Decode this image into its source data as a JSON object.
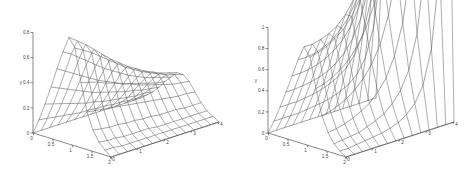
{
  "figure": {
    "type": "two-panel-3d-surface-figure",
    "background_color": "#ffffff",
    "line_color": "#6b6b6b",
    "axis_color": "#555555",
    "panels": [
      "left",
      "right"
    ]
  },
  "chart_data": [
    {
      "type": "line",
      "plot_style": "3d-mesh-surface",
      "panel": "left",
      "title": "",
      "xlabel": "",
      "ylabel": "y",
      "zlabel": "",
      "xlim": [
        0,
        2
      ],
      "ylim": [
        0,
        0.8
      ],
      "zlim": [
        0,
        4
      ],
      "grid": false,
      "legend": "none",
      "xticks": [
        "0",
        "0.5",
        "1",
        "1.5",
        "2"
      ],
      "xtick_values": [
        0,
        0.5,
        1,
        1.5,
        2
      ],
      "yticks": [
        "0",
        "0.2",
        "0.4",
        "0.6",
        "0.8"
      ],
      "ytick_values": [
        0,
        0.2,
        0.4,
        0.6,
        0.8
      ],
      "zticks": [
        "0",
        "1",
        "2",
        "3",
        "4"
      ],
      "ztick_values": [
        0,
        1,
        2,
        3,
        4
      ],
      "x": [
        0,
        0.1538,
        0.3077,
        0.4615,
        0.6154,
        0.7692,
        0.9231,
        1.0769,
        1.2308,
        1.3846,
        1.5385,
        1.6923,
        1.8462,
        2
      ],
      "t": [
        0,
        0.3077,
        0.6154,
        0.9231,
        1.2308,
        1.5385,
        1.8462,
        2.1538,
        2.4615,
        2.7692,
        3.0769,
        3.3846,
        3.6923,
        4
      ],
      "series": [
        {
          "name": "t=0",
          "values": [
            0.0,
            0.12,
            0.26,
            0.41,
            0.57,
            0.72,
            0.85,
            0.78,
            0.52,
            0.3,
            0.17,
            0.09,
            0.04,
            0.0
          ]
        },
        {
          "name": "t=0.31",
          "values": [
            0.0,
            0.11,
            0.24,
            0.38,
            0.53,
            0.68,
            0.8,
            0.74,
            0.5,
            0.29,
            0.16,
            0.08,
            0.04,
            0.0
          ]
        },
        {
          "name": "t=0.62",
          "values": [
            0.0,
            0.1,
            0.22,
            0.35,
            0.49,
            0.63,
            0.75,
            0.7,
            0.48,
            0.28,
            0.15,
            0.08,
            0.03,
            0.0
          ]
        },
        {
          "name": "t=0.92",
          "values": [
            0.0,
            0.09,
            0.2,
            0.32,
            0.45,
            0.58,
            0.69,
            0.65,
            0.45,
            0.27,
            0.15,
            0.07,
            0.03,
            0.0
          ]
        },
        {
          "name": "t=1.23",
          "values": [
            0.0,
            0.08,
            0.18,
            0.29,
            0.41,
            0.53,
            0.63,
            0.6,
            0.43,
            0.26,
            0.14,
            0.07,
            0.03,
            0.0
          ]
        },
        {
          "name": "t=1.54",
          "values": [
            0.0,
            0.07,
            0.16,
            0.26,
            0.37,
            0.48,
            0.57,
            0.55,
            0.4,
            0.25,
            0.14,
            0.07,
            0.03,
            0.0
          ]
        },
        {
          "name": "t=1.85",
          "values": [
            0.0,
            0.07,
            0.15,
            0.24,
            0.34,
            0.44,
            0.52,
            0.5,
            0.38,
            0.24,
            0.13,
            0.07,
            0.03,
            0.0
          ]
        },
        {
          "name": "t=2.15",
          "values": [
            0.0,
            0.06,
            0.13,
            0.22,
            0.31,
            0.4,
            0.47,
            0.46,
            0.35,
            0.23,
            0.13,
            0.06,
            0.03,
            0.0
          ]
        },
        {
          "name": "t=2.46",
          "values": [
            0.0,
            0.06,
            0.12,
            0.2,
            0.28,
            0.36,
            0.43,
            0.42,
            0.33,
            0.22,
            0.12,
            0.06,
            0.03,
            0.0
          ]
        },
        {
          "name": "t=2.77",
          "values": [
            0.0,
            0.05,
            0.11,
            0.18,
            0.26,
            0.33,
            0.39,
            0.39,
            0.31,
            0.21,
            0.12,
            0.06,
            0.03,
            0.0
          ]
        },
        {
          "name": "t=3.08",
          "values": [
            0.0,
            0.05,
            0.1,
            0.17,
            0.24,
            0.3,
            0.36,
            0.36,
            0.29,
            0.2,
            0.12,
            0.06,
            0.03,
            0.0
          ]
        },
        {
          "name": "t=3.38",
          "values": [
            0.0,
            0.04,
            0.09,
            0.15,
            0.22,
            0.28,
            0.33,
            0.33,
            0.27,
            0.19,
            0.11,
            0.06,
            0.03,
            0.0
          ]
        },
        {
          "name": "t=3.69",
          "values": [
            0.0,
            0.04,
            0.09,
            0.14,
            0.2,
            0.26,
            0.31,
            0.31,
            0.26,
            0.19,
            0.11,
            0.06,
            0.03,
            0.0
          ]
        },
        {
          "name": "t=4",
          "values": [
            0.0,
            0.04,
            0.08,
            0.13,
            0.19,
            0.24,
            0.29,
            0.29,
            0.25,
            0.18,
            0.11,
            0.06,
            0.03,
            0.0
          ]
        }
      ]
    },
    {
      "type": "line",
      "plot_style": "3d-mesh-surface",
      "panel": "right",
      "title": "",
      "xlabel": "",
      "ylabel": "y",
      "zlabel": "",
      "xlim": [
        0,
        2
      ],
      "ylim": [
        0,
        1
      ],
      "zlim": [
        0,
        4
      ],
      "grid": false,
      "legend": "none",
      "xticks": [
        "0",
        "0.5",
        "1",
        "1.5",
        "2"
      ],
      "xtick_values": [
        0,
        0.5,
        1,
        1.5,
        2
      ],
      "yticks": [
        "0",
        "0.2",
        "0.4",
        "0.6",
        "0.8",
        "1"
      ],
      "ytick_values": [
        0,
        0.2,
        0.4,
        0.6,
        0.8,
        1.0
      ],
      "zticks": [
        "0",
        "1",
        "2",
        "3",
        "4"
      ],
      "ztick_values": [
        0,
        1,
        2,
        3,
        4
      ],
      "x": [
        0,
        0.1538,
        0.3077,
        0.4615,
        0.6154,
        0.7692,
        0.9231,
        1.0769,
        1.2308,
        1.3846,
        1.5385,
        1.6923,
        1.8462,
        2
      ],
      "t": [
        0,
        0.3077,
        0.6154,
        0.9231,
        1.2308,
        1.5385,
        1.8462,
        2.1538,
        2.4615,
        2.7692,
        3.0769,
        3.3846,
        3.6923,
        4
      ],
      "series": [
        {
          "name": "t=0",
          "values": [
            0.0,
            0.13,
            0.28,
            0.44,
            0.61,
            0.78,
            0.92,
            0.84,
            0.56,
            0.32,
            0.18,
            0.09,
            0.04,
            0.0
          ]
        },
        {
          "name": "t=0.31",
          "values": [
            0.0,
            0.13,
            0.28,
            0.44,
            0.61,
            0.78,
            0.92,
            0.86,
            0.58,
            0.34,
            0.19,
            0.1,
            0.04,
            0.0
          ]
        },
        {
          "name": "t=0.62",
          "values": [
            0.0,
            0.13,
            0.28,
            0.45,
            0.62,
            0.79,
            0.94,
            0.89,
            0.62,
            0.37,
            0.21,
            0.11,
            0.05,
            0.0
          ]
        },
        {
          "name": "t=0.92",
          "values": [
            0.0,
            0.13,
            0.29,
            0.46,
            0.64,
            0.82,
            0.97,
            0.94,
            0.67,
            0.41,
            0.24,
            0.12,
            0.06,
            0.0
          ]
        },
        {
          "name": "t=1.23",
          "values": [
            0.0,
            0.14,
            0.3,
            0.48,
            0.67,
            0.86,
            1.02,
            1.0,
            0.74,
            0.47,
            0.28,
            0.15,
            0.07,
            0.0
          ]
        },
        {
          "name": "t=1.54",
          "values": [
            0.0,
            0.15,
            0.32,
            0.51,
            0.72,
            0.93,
            1.1,
            1.1,
            0.84,
            0.55,
            0.33,
            0.18,
            0.08,
            0.0
          ]
        },
        {
          "name": "t=1.85",
          "values": [
            0.0,
            0.16,
            0.35,
            0.56,
            0.79,
            1.02,
            1.22,
            1.24,
            0.98,
            0.66,
            0.41,
            0.22,
            0.1,
            0.0
          ]
        },
        {
          "name": "t=2.15",
          "values": [
            0.0,
            0.18,
            0.39,
            0.63,
            0.89,
            1.16,
            1.4,
            1.45,
            1.18,
            0.82,
            0.52,
            0.29,
            0.13,
            0.0
          ]
        },
        {
          "name": "t=2.46",
          "values": [
            0.0,
            0.21,
            0.45,
            0.74,
            1.05,
            1.38,
            1.68,
            1.78,
            1.49,
            1.07,
            0.7,
            0.39,
            0.18,
            0.0
          ]
        },
        {
          "name": "t=2.77",
          "values": [
            0.0,
            0.25,
            0.55,
            0.91,
            1.31,
            1.74,
            2.15,
            2.33,
            2.01,
            1.48,
            0.99,
            0.56,
            0.26,
            0.0
          ]
        },
        {
          "name": "t=3.08",
          "values": [
            0.0,
            0.32,
            0.72,
            1.2,
            1.76,
            2.38,
            3.0,
            3.32,
            2.95,
            2.23,
            1.53,
            0.88,
            0.41,
            0.0
          ]
        },
        {
          "name": "t=3.38",
          "values": [
            0.0,
            0.45,
            1.04,
            1.77,
            2.64,
            3.64,
            4.68,
            5.29,
            4.82,
            3.74,
            2.62,
            1.53,
            0.73,
            0.0
          ]
        },
        {
          "name": "t=3.69",
          "values": [
            0.0,
            0.72,
            1.7,
            2.96,
            4.52,
            6.36,
            8.34,
            9.62,
            8.94,
            7.09,
            5.07,
            3.02,
            1.46,
            0.0
          ]
        },
        {
          "name": "t=4",
          "values": [
            0.0,
            1.3,
            3.15,
            5.62,
            8.78,
            12.6,
            16.9,
            19.9,
            18.9,
            15.3,
            11.2,
            6.8,
            3.34,
            0.0
          ]
        }
      ]
    }
  ],
  "left_panel": {
    "name": "left-surface-plot",
    "axis_label_y": "y",
    "y_ticks": [
      "0.8",
      "0.6",
      "0.4",
      "0.2",
      "0"
    ],
    "x_ticks": [
      "0",
      "0.5",
      "1",
      "1.5",
      "2"
    ],
    "z_ticks": [
      "0",
      "1",
      "2",
      "3",
      "4"
    ]
  },
  "right_panel": {
    "name": "right-surface-plot",
    "axis_label_y": "y",
    "y_ticks": [
      "1",
      "0.8",
      "0.6",
      "0.4",
      "0.2",
      "0"
    ],
    "x_ticks": [
      "0",
      "0.5",
      "1",
      "1.5",
      "2"
    ],
    "z_ticks": [
      "0",
      "1",
      "2",
      "3",
      "4"
    ]
  }
}
